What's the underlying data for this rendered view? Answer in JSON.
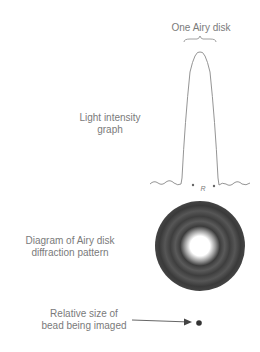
{
  "labels": {
    "airy_disk_top": "One Airy disk",
    "graph_label_line1": "Light intensity",
    "graph_label_line2": "graph",
    "radius_symbol": "R",
    "pattern_label_line1": "Diagram of Airy disk",
    "pattern_label_line2": "diffraction pattern",
    "bead_label_line1": "Relative size of",
    "bead_label_line2": "bead being imaged"
  },
  "colors": {
    "line": "#888888",
    "text": "#7a7a7a",
    "disk_dark": "#3a3a3a",
    "disk_center": "#ffffff",
    "bead": "#333333"
  }
}
